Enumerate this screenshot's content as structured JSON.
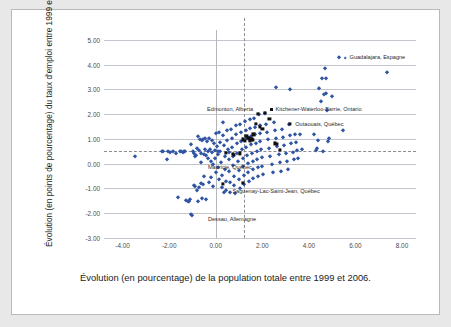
{
  "figure": {
    "ylabel": "Évolution (en points de pourcentage) du taux d'emploi entre 1999 et 2006",
    "caption": "Évolution (en pourcentage) de la population totale entre 1999 et 2006."
  },
  "chart_data": {
    "type": "scatter",
    "title": "",
    "xlabel": "Évolution (en pourcentage) de la population totale entre 1999 et 2006.",
    "ylabel": "Évolution (en points de pourcentage) du taux d'emploi entre 1999 et 2006",
    "xlim": [
      -4.8,
      8.6
    ],
    "ylim": [
      -3.0,
      5.4
    ],
    "xticks": [
      "-4.00",
      "-2.00",
      "0.00",
      "2.00",
      "4.00",
      "6.00",
      "8.00"
    ],
    "xtick_values": [
      -4,
      -2,
      0,
      2,
      4,
      6,
      8
    ],
    "yticks": [
      "5.00",
      "4.00",
      "3.00",
      "2.00",
      "1.00",
      "0.00",
      "-1.00",
      "-2.00",
      "-3.00"
    ],
    "ytick_values": [
      5,
      4,
      3,
      2,
      1,
      0,
      -1,
      -2,
      -3
    ],
    "grid": "horizontal",
    "legend": "none",
    "reference_lines": [
      {
        "orientation": "vertical",
        "value": 1.2,
        "style": "dashed"
      },
      {
        "orientation": "horizontal",
        "value": 0.5,
        "style": "dashed"
      },
      {
        "orientation": "vertical",
        "value": 0.0,
        "style": "solid"
      }
    ],
    "series": [
      {
        "name": "régions",
        "marker": "diamond",
        "color": "#2f55a4",
        "points": [
          [
            -3.45,
            0.3
          ],
          [
            -2.3,
            0.5
          ],
          [
            -2.25,
            0.52
          ],
          [
            -2.1,
            0.18
          ],
          [
            -1.95,
            0.48
          ],
          [
            -1.85,
            0.5
          ],
          [
            -1.7,
            0.45
          ],
          [
            -1.62,
            -1.35
          ],
          [
            -1.5,
            0.5
          ],
          [
            -1.42,
            0.48
          ],
          [
            -1.35,
            0.52
          ],
          [
            -1.3,
            0.5
          ],
          [
            -1.28,
            -1.45
          ],
          [
            -1.2,
            -1.5
          ],
          [
            -1.15,
            -1.52
          ],
          [
            -1.12,
            -1.42
          ],
          [
            -1.08,
            0.78
          ],
          [
            -1.05,
            -2.05
          ],
          [
            -1.0,
            -2.08
          ],
          [
            -0.98,
            0.5
          ],
          [
            -0.95,
            0.42
          ],
          [
            -0.92,
            -0.85
          ],
          [
            -0.9,
            -0.88
          ],
          [
            -0.88,
            0.3
          ],
          [
            -0.85,
            0.35
          ],
          [
            -0.82,
            -1.05
          ],
          [
            -0.8,
            0.62
          ],
          [
            -0.78,
            1.1
          ],
          [
            -0.75,
            -1.5
          ],
          [
            -0.72,
            -0.95
          ],
          [
            -0.7,
            0.55
          ],
          [
            -0.68,
            1.0
          ],
          [
            -0.65,
            0.45
          ],
          [
            -0.62,
            0.08
          ],
          [
            -0.6,
            -1.38
          ],
          [
            -0.58,
            0.95
          ],
          [
            -0.55,
            1.0
          ],
          [
            -0.52,
            0.38
          ],
          [
            -0.5,
            -0.5
          ],
          [
            -0.48,
            1.02
          ],
          [
            -0.45,
            0.6
          ],
          [
            -0.42,
            0.35
          ],
          [
            -0.4,
            -1.42
          ],
          [
            -0.38,
            0.92
          ],
          [
            -0.35,
            0.5
          ],
          [
            -0.32,
            0.22
          ],
          [
            -0.3,
            -0.75
          ],
          [
            -0.28,
            1.05
          ],
          [
            -0.25,
            0.6
          ],
          [
            -0.22,
            0.1
          ],
          [
            -0.2,
            -0.55
          ],
          [
            -0.18,
            0.95
          ],
          [
            -0.15,
            0.48
          ],
          [
            -0.12,
            0.0
          ],
          [
            -0.1,
            -0.9
          ],
          [
            -0.08,
            0.85
          ],
          [
            -0.05,
            0.55
          ],
          [
            -0.02,
            0.25
          ],
          [
            0.0,
            -0.35
          ],
          [
            0.02,
            1.25
          ],
          [
            0.05,
            0.72
          ],
          [
            0.08,
            0.4
          ],
          [
            0.1,
            -0.15
          ],
          [
            0.12,
            -0.62
          ],
          [
            0.15,
            1.3
          ],
          [
            0.18,
            0.88
          ],
          [
            0.2,
            0.52
          ],
          [
            0.22,
            0.08
          ],
          [
            0.25,
            -0.45
          ],
          [
            0.28,
            -0.95
          ],
          [
            0.3,
            1.68
          ],
          [
            0.32,
            1.15
          ],
          [
            0.35,
            0.75
          ],
          [
            0.38,
            0.3
          ],
          [
            0.4,
            -0.2
          ],
          [
            0.42,
            -0.68
          ],
          [
            0.45,
            -1.05
          ],
          [
            0.48,
            1.35
          ],
          [
            0.5,
            0.95
          ],
          [
            0.52,
            0.58
          ],
          [
            0.55,
            0.2
          ],
          [
            0.58,
            -0.3
          ],
          [
            0.6,
            -0.72
          ],
          [
            0.62,
            -1.15
          ],
          [
            0.65,
            1.42
          ],
          [
            0.68,
            1.05
          ],
          [
            0.7,
            0.68
          ],
          [
            0.72,
            0.32
          ],
          [
            0.75,
            -0.05
          ],
          [
            0.78,
            -0.48
          ],
          [
            0.8,
            -0.85
          ],
          [
            0.82,
            -1.18
          ],
          [
            0.85,
            1.55
          ],
          [
            0.88,
            1.18
          ],
          [
            0.9,
            0.82
          ],
          [
            0.92,
            0.45
          ],
          [
            0.95,
            0.12
          ],
          [
            0.98,
            -0.25
          ],
          [
            1.0,
            -0.6
          ],
          [
            1.02,
            -0.98
          ],
          [
            1.05,
            1.62
          ],
          [
            1.08,
            1.28
          ],
          [
            1.1,
            0.92
          ],
          [
            1.12,
            0.58
          ],
          [
            1.15,
            0.25
          ],
          [
            1.18,
            -0.1
          ],
          [
            1.2,
            -0.45
          ],
          [
            1.22,
            -0.82
          ],
          [
            1.25,
            1.72
          ],
          [
            1.28,
            1.38
          ],
          [
            1.3,
            1.02
          ],
          [
            1.32,
            0.68
          ],
          [
            1.35,
            0.35
          ],
          [
            1.38,
            0.02
          ],
          [
            1.4,
            -0.32
          ],
          [
            1.42,
            -0.68
          ],
          [
            1.45,
            1.8
          ],
          [
            1.48,
            1.45
          ],
          [
            1.5,
            1.1
          ],
          [
            1.52,
            0.78
          ],
          [
            1.55,
            0.45
          ],
          [
            1.58,
            0.12
          ],
          [
            1.6,
            -0.22
          ],
          [
            1.62,
            -0.58
          ],
          [
            1.65,
            1.85
          ],
          [
            1.68,
            1.5
          ],
          [
            1.7,
            1.18
          ],
          [
            1.72,
            0.85
          ],
          [
            1.75,
            0.52
          ],
          [
            1.78,
            0.2
          ],
          [
            1.8,
            -0.15
          ],
          [
            1.82,
            -0.5
          ],
          [
            1.85,
            2.0
          ],
          [
            1.88,
            1.58
          ],
          [
            1.9,
            1.25
          ],
          [
            1.92,
            0.92
          ],
          [
            1.95,
            0.6
          ],
          [
            1.98,
            0.28
          ],
          [
            2.0,
            -0.08
          ],
          [
            2.05,
            -0.42
          ],
          [
            2.1,
            2.05
          ],
          [
            2.15,
            1.62
          ],
          [
            2.2,
            1.3
          ],
          [
            2.25,
            0.98
          ],
          [
            2.3,
            0.65
          ],
          [
            2.35,
            0.32
          ],
          [
            2.4,
            0.0
          ],
          [
            2.45,
            -0.35
          ],
          [
            2.5,
            1.68
          ],
          [
            2.55,
            1.35
          ],
          [
            2.6,
            1.02
          ],
          [
            2.65,
            0.7
          ],
          [
            2.7,
            0.38
          ],
          [
            2.75,
            0.05
          ],
          [
            2.8,
            -0.3
          ],
          [
            2.85,
            1.42
          ],
          [
            2.9,
            1.08
          ],
          [
            2.95,
            0.75
          ],
          [
            3.0,
            0.42
          ],
          [
            3.05,
            0.1
          ],
          [
            3.1,
            -0.22
          ],
          [
            3.15,
            1.62
          ],
          [
            3.2,
            1.15
          ],
          [
            3.25,
            0.82
          ],
          [
            3.3,
            0.48
          ],
          [
            3.35,
            0.18
          ],
          [
            3.4,
            1.2
          ],
          [
            3.45,
            0.88
          ],
          [
            3.5,
            0.55
          ],
          [
            3.55,
            0.25
          ],
          [
            3.6,
            1.18
          ],
          [
            3.7,
            0.6
          ],
          [
            3.2,
            3.0
          ],
          [
            2.6,
            3.1
          ],
          [
            4.2,
            1.22
          ],
          [
            4.3,
            0.55
          ],
          [
            4.35,
            0.62
          ],
          [
            4.4,
            0.95
          ],
          [
            4.45,
            3.05
          ],
          [
            4.5,
            2.55
          ],
          [
            4.55,
            3.45
          ],
          [
            4.6,
            0.52
          ],
          [
            4.65,
            2.8
          ],
          [
            4.7,
            3.88
          ],
          [
            4.72,
            2.85
          ],
          [
            4.75,
            3.45
          ],
          [
            4.78,
            2.15
          ],
          [
            4.8,
            0.92
          ],
          [
            4.85,
            1.05
          ],
          [
            5.0,
            2.75
          ],
          [
            5.3,
            4.3
          ],
          [
            5.45,
            1.35
          ],
          [
            7.35,
            3.72
          ],
          [
            -1.55,
            0.5
          ],
          [
            -2.05,
            0.5
          ],
          [
            0.35,
            -1.15
          ],
          [
            -0.65,
            -0.78
          ],
          [
            -0.55,
            -0.82
          ],
          [
            0.08,
            0.5
          ],
          [
            0.55,
            0.48
          ]
        ]
      },
      {
        "name": "régions mises en évidence",
        "marker": "square",
        "color": "#101010",
        "points": [
          [
            1.38,
            1.05
          ],
          [
            1.42,
            1.02
          ],
          [
            1.5,
            1.0
          ],
          [
            1.55,
            0.98
          ],
          [
            1.6,
            0.95
          ],
          [
            1.45,
            0.92
          ],
          [
            1.82,
            2.0
          ],
          [
            2.12,
            2.05
          ],
          [
            2.3,
            1.8
          ],
          [
            1.72,
            1.62
          ],
          [
            2.55,
            0.82
          ],
          [
            2.62,
            0.8
          ],
          [
            2.75,
            0.55
          ],
          [
            3.2,
            1.62
          ],
          [
            0.72,
            0.38
          ],
          [
            0.78,
            0.35
          ],
          [
            1.05,
            0.42
          ],
          [
            0.45,
            0.45
          ],
          [
            1.32,
            1.12
          ],
          [
            1.62,
            1.18
          ],
          [
            2.0,
            1.42
          ],
          [
            1.15,
            -0.78
          ],
          [
            0.3,
            -0.82
          ],
          [
            1.9,
            1.5
          ],
          [
            1.25,
            0.92
          ],
          [
            1.18,
            0.98
          ]
        ]
      }
    ],
    "annotations": [
      {
        "text": "Guadalajara, Espagne",
        "x": 5.3,
        "y": 4.3,
        "align": "left",
        "marker": "diamond"
      },
      {
        "text": "Edmonton, Alberta",
        "x": 1.82,
        "y": 2.22,
        "align": "right",
        "marker": "none"
      },
      {
        "text": "Kitchener-Waterloo-Barrie, Ontario",
        "x": 2.12,
        "y": 2.22,
        "align": "left",
        "marker": "square"
      },
      {
        "text": "Outaouais, Québec",
        "x": 3.2,
        "y": 1.62,
        "align": "left",
        "marker": "none"
      },
      {
        "text": "Mauricie, Québec",
        "x": -0.55,
        "y": -0.12,
        "align": "left",
        "marker": "none"
      },
      {
        "text": "Saguenay-Lac-Saint-Jean, Québec",
        "x": 0.5,
        "y": -1.12,
        "align": "left",
        "marker": "none"
      },
      {
        "text": "Dessau, Allemagne",
        "x": -0.55,
        "y": -2.22,
        "align": "left",
        "marker": "none"
      }
    ]
  }
}
